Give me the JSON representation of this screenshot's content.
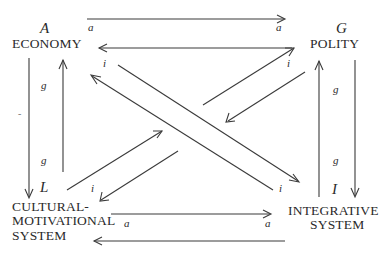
{
  "diagram": {
    "type": "AGIL functional interchange paradigm",
    "cells": {
      "A": {
        "letter": "A",
        "name": "ECONOMY"
      },
      "G": {
        "letter": "G",
        "name": "POLITY"
      },
      "L": {
        "letter": "L",
        "name_lines": [
          "CULTURAL-",
          "MOTIVATIONAL",
          "SYSTEM"
        ]
      },
      "I": {
        "letter": "I",
        "name_lines": [
          "INTEGRATIVE",
          "SYSTEM"
        ]
      }
    },
    "interchange_labels": {
      "top_left_a": "a",
      "top_right_a": "a",
      "bottom_left_a": "a",
      "bottom_right_a": "a",
      "left_upper_g": "g",
      "left_lower_g": "g",
      "right_upper_g": "g",
      "right_lower_g": "g",
      "diag_a_i": "i",
      "diag_g_i": "i",
      "diag_l_i": "i",
      "diag_i_i": "i"
    },
    "stray_mark": "-",
    "arrows": [
      {
        "from": "A",
        "to": "G",
        "label": "a"
      },
      {
        "from": "G",
        "to": "A",
        "label": "a"
      },
      {
        "from": "A",
        "to": "L",
        "label": "g"
      },
      {
        "from": "L",
        "to": "A",
        "label": "g"
      },
      {
        "from": "G",
        "to": "I",
        "label": "g"
      },
      {
        "from": "I",
        "to": "G",
        "label": "g"
      },
      {
        "from": "L",
        "to": "I",
        "label": "a"
      },
      {
        "from": "I",
        "to": "L",
        "label": "a"
      },
      {
        "from": "A",
        "to": "I",
        "label": "i"
      },
      {
        "from": "I",
        "to": "A",
        "label": "i"
      },
      {
        "from": "L",
        "to": "G",
        "label": "i"
      },
      {
        "from": "G",
        "to": "L",
        "label": "i"
      }
    ]
  }
}
